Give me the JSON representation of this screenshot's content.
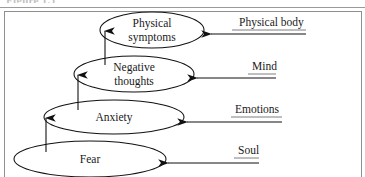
{
  "figure": {
    "caption_fragment": "Figure 1.1",
    "frame": {
      "border_color": "#8f8f8f"
    },
    "stroke_color": "#111111"
  },
  "diagram": {
    "type": "layered-ellipse-stack",
    "nodes": [
      {
        "id": "physical-symptoms",
        "lines": [
          "Physical",
          "symptoms"
        ],
        "level": 4,
        "cx": 152,
        "cy": 30,
        "rx": 52,
        "ry": 18
      },
      {
        "id": "negative-thoughts",
        "lines": [
          "Negative",
          "thoughts"
        ],
        "level": 3,
        "cx": 134,
        "cy": 74,
        "rx": 60,
        "ry": 18
      },
      {
        "id": "anxiety",
        "lines": [
          "Anxiety"
        ],
        "level": 2,
        "cx": 114,
        "cy": 117,
        "rx": 70,
        "ry": 17
      },
      {
        "id": "fear",
        "lines": [
          "Fear"
        ],
        "level": 1,
        "cx": 90,
        "cy": 159,
        "rx": 76,
        "ry": 18
      }
    ],
    "up_arrows": [
      {
        "id": "fear-to-anxiety",
        "from": "fear",
        "to": "anxiety",
        "x": 46,
        "y_start": 152,
        "y_end": 118
      },
      {
        "id": "anxiety-to-negative-thoughts",
        "from": "anxiety",
        "to": "negative-thoughts",
        "x": 78,
        "y_start": 110,
        "y_end": 75
      },
      {
        "id": "negative-thoughts-to-physical-symptoms",
        "from": "negative-thoughts",
        "to": "physical-symptoms",
        "x": 105,
        "y_start": 65,
        "y_end": 31
      }
    ],
    "side_labels": [
      {
        "id": "physical-body",
        "text": "Physical body",
        "target": "physical-symptoms",
        "text_x": 239,
        "text_y": 26,
        "arrow_y": 34,
        "arrow_tail_x": 306,
        "arrow_head_x": 211,
        "underline_x1": 232,
        "underline_x2": 306,
        "underline_y": 30
      },
      {
        "id": "mind",
        "text": "Mind",
        "target": "negative-thoughts",
        "text_x": 252,
        "text_y": 70,
        "arrow_y": 78,
        "arrow_tail_x": 276,
        "arrow_head_x": 197,
        "underline_x1": 248,
        "underline_x2": 276,
        "underline_y": 74
      },
      {
        "id": "emotions",
        "text": "Emotions",
        "target": "anxiety",
        "text_x": 235,
        "text_y": 113,
        "arrow_y": 122,
        "arrow_tail_x": 282,
        "arrow_head_x": 187,
        "underline_x1": 231,
        "underline_x2": 282,
        "underline_y": 117
      },
      {
        "id": "soul",
        "text": "Soul",
        "target": "fear",
        "text_x": 238,
        "text_y": 154,
        "arrow_y": 163,
        "arrow_tail_x": 259,
        "arrow_head_x": 168,
        "underline_x1": 234,
        "underline_x2": 259,
        "underline_y": 158
      }
    ]
  }
}
